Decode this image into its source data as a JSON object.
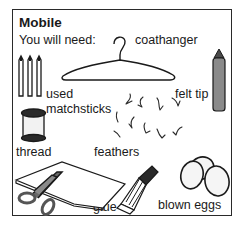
{
  "title": "Mobile",
  "subtitle": "You will need:",
  "items": [
    {
      "label": "coathanger",
      "icon": "coathanger-icon"
    },
    {
      "label": "used",
      "icon": "matchsticks-icon"
    },
    {
      "label": "matchsticks",
      "icon": "matchsticks-icon"
    },
    {
      "label": "felt tip",
      "icon": "felt-tip-pen-icon"
    },
    {
      "label": "thread",
      "icon": "thread-spool-icon"
    },
    {
      "label": "feathers",
      "icon": "feathers-icon"
    },
    {
      "label": "card",
      "icon": "card-icon"
    },
    {
      "label": "glue",
      "icon": "glue-tube-icon"
    },
    {
      "label": "blown eggs",
      "icon": "eggs-icon"
    }
  ],
  "colors": {
    "ink": "#1a1a1a",
    "pen_grey": "#8a8a8a",
    "background": "#ffffff"
  }
}
